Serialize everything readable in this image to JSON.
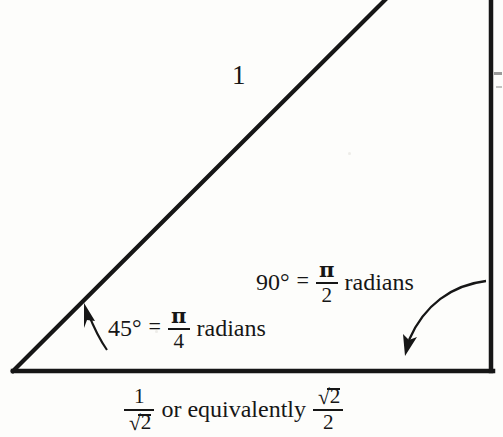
{
  "figure": {
    "background_color": "#fdfdfb",
    "ink_color": "#161616"
  },
  "triangle": {
    "vertices": {
      "bottom_left": [
        13,
        371
      ],
      "bottom_right": [
        492,
        371
      ],
      "apex_offscreen": [
        492,
        -210
      ]
    },
    "hypotenuse_label": "1",
    "base_label_parts": {
      "numerator_1": "1",
      "denominator_sqrt2_surd": "√",
      "denominator_sqrt2_radicand": "2",
      "connector": "or equivalently",
      "numerator_sqrt2_surd": "√",
      "numerator_sqrt2_radicand": "2",
      "denominator_2": "2"
    }
  },
  "annotations": {
    "right_angle": {
      "degrees": "90°",
      "equals": "=",
      "fraction_numerator": "π",
      "fraction_denominator": "2",
      "unit": "radians"
    },
    "acute_angle": {
      "degrees": "45°",
      "equals": "=",
      "fraction_numerator": "π",
      "fraction_denominator": "4",
      "unit": "radians"
    }
  },
  "arrows": {
    "right_angle_pointer": "curved-arrow-down-left",
    "acute_angle_pointer": "arrow-up-left"
  }
}
